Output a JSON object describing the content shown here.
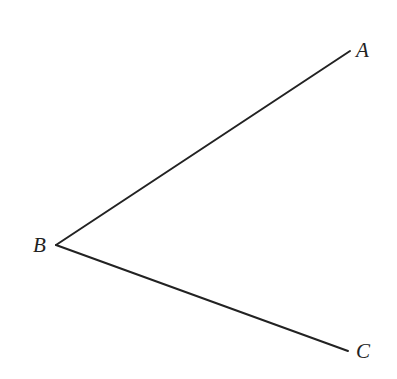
{
  "diagram": {
    "type": "angle",
    "stroke_color": "#222222",
    "points": {
      "A": {
        "label": "A",
        "x": 350,
        "y": 51
      },
      "B": {
        "label": "B",
        "x": 56,
        "y": 245
      },
      "C": {
        "label": "C",
        "x": 348,
        "y": 351
      }
    },
    "segments": [
      {
        "from": "B",
        "to": "A"
      },
      {
        "from": "B",
        "to": "C"
      }
    ]
  }
}
